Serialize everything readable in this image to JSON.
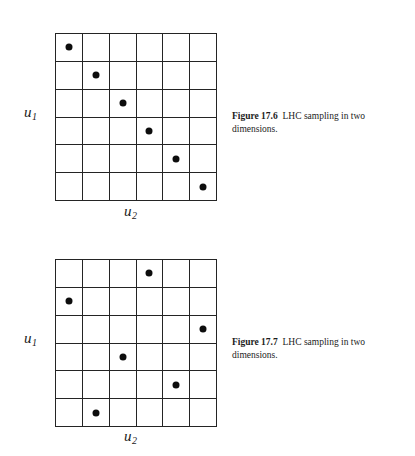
{
  "page": {
    "background": "#ffffff",
    "ink": "#1a1a1a",
    "dot_color": "#0d0d0d",
    "grid_line_color": "#242424"
  },
  "figures": [
    {
      "id": "figure-17-6",
      "caption_label": "Figure 17.6",
      "caption_text": "LHC sampling in two dimensions.",
      "axis": {
        "y_label": "u",
        "y_subscript": "1",
        "x_label": "u",
        "x_subscript": "2"
      },
      "grid": {
        "rows": 6,
        "cols": 6
      },
      "points": [
        {
          "row": 1,
          "col": 1
        },
        {
          "row": 2,
          "col": 2
        },
        {
          "row": 3,
          "col": 3
        },
        {
          "row": 4,
          "col": 4
        },
        {
          "row": 5,
          "col": 5
        },
        {
          "row": 6,
          "col": 6
        }
      ]
    },
    {
      "id": "figure-17-7",
      "caption_label": "Figure 17.7",
      "caption_text": "LHC sampling in two dimensions.",
      "axis": {
        "y_label": "u",
        "y_subscript": "1",
        "x_label": "u",
        "x_subscript": "2"
      },
      "grid": {
        "rows": 6,
        "cols": 6
      },
      "points": [
        {
          "row": 1,
          "col": 4
        },
        {
          "row": 2,
          "col": 1
        },
        {
          "row": 3,
          "col": 6
        },
        {
          "row": 4,
          "col": 3
        },
        {
          "row": 5,
          "col": 5
        },
        {
          "row": 6,
          "col": 2
        }
      ]
    }
  ],
  "chart_data": [
    {
      "type": "scatter",
      "title": "Figure 17.6 LHC sampling in two dimensions.",
      "xlabel": "u2",
      "ylabel": "u1",
      "grid": true,
      "xlim": [
        0,
        6
      ],
      "ylim": [
        0,
        6
      ],
      "xticks": [
        0,
        1,
        2,
        3,
        4,
        5,
        6
      ],
      "yticks": [
        0,
        1,
        2,
        3,
        4,
        5,
        6
      ],
      "x": [
        0.5,
        1.5,
        2.5,
        3.5,
        4.5,
        5.5
      ],
      "y": [
        5.5,
        4.5,
        3.5,
        2.5,
        1.5,
        0.5
      ],
      "series": [
        {
          "name": "LHC samples (diagonal)",
          "points": [
            {
              "x": 0.5,
              "y": 5.5
            },
            {
              "x": 1.5,
              "y": 4.5
            },
            {
              "x": 2.5,
              "y": 3.5
            },
            {
              "x": 3.5,
              "y": 2.5
            },
            {
              "x": 4.5,
              "y": 1.5
            },
            {
              "x": 5.5,
              "y": 0.5
            }
          ]
        }
      ]
    },
    {
      "type": "scatter",
      "title": "Figure 17.7 LHC sampling in two dimensions.",
      "xlabel": "u2",
      "ylabel": "u1",
      "grid": true,
      "xlim": [
        0,
        6
      ],
      "ylim": [
        0,
        6
      ],
      "xticks": [
        0,
        1,
        2,
        3,
        4,
        5,
        6
      ],
      "yticks": [
        0,
        1,
        2,
        3,
        4,
        5,
        6
      ],
      "x": [
        3.5,
        0.5,
        5.5,
        2.5,
        4.5,
        1.5
      ],
      "y": [
        5.5,
        4.5,
        3.5,
        2.5,
        1.5,
        0.5
      ],
      "series": [
        {
          "name": "LHC samples (permuted)",
          "points": [
            {
              "x": 3.5,
              "y": 5.5
            },
            {
              "x": 0.5,
              "y": 4.5
            },
            {
              "x": 5.5,
              "y": 3.5
            },
            {
              "x": 2.5,
              "y": 2.5
            },
            {
              "x": 4.5,
              "y": 1.5
            },
            {
              "x": 1.5,
              "y": 0.5
            }
          ]
        }
      ]
    }
  ]
}
